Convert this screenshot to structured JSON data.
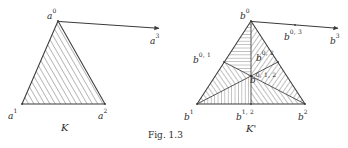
{
  "figure": {
    "caption": "Fig. 1.3",
    "stroke_color": "#3a3a3a",
    "hatch_color": "#4a4a4a",
    "background": "#ffffff"
  },
  "left_complex": {
    "name": "K",
    "vertices": [
      {
        "id": "a0",
        "base": "a",
        "sup": "0",
        "x": 58,
        "y": 21,
        "label_x": 47,
        "label_y": 6
      },
      {
        "id": "a1",
        "base": "a",
        "sup": "1",
        "x": 22,
        "y": 104,
        "label_x": 8,
        "label_y": 106
      },
      {
        "id": "a2",
        "base": "a",
        "sup": "2",
        "x": 105,
        "y": 104,
        "label_x": 98,
        "label_y": 106
      },
      {
        "id": "a3",
        "base": "a",
        "sup": "3",
        "x": 160,
        "y": 29,
        "label_x": 150,
        "label_y": 31
      }
    ],
    "edge_arrow": {
      "from": "a0",
      "to": "a3"
    }
  },
  "right_complex": {
    "name": "K'",
    "vertices": [
      {
        "id": "b0",
        "base": "b",
        "sup": "0",
        "x": 251,
        "y": 21,
        "label_x": 240,
        "label_y": 6
      },
      {
        "id": "b1",
        "base": "b",
        "sup": "1",
        "x": 197,
        "y": 104,
        "label_x": 184,
        "label_y": 107
      },
      {
        "id": "b2",
        "base": "b",
        "sup": "2",
        "x": 305,
        "y": 104,
        "label_x": 298,
        "label_y": 107
      },
      {
        "id": "b3",
        "base": "b",
        "sup": "3",
        "x": 339,
        "y": 29,
        "label_x": 330,
        "label_y": 31
      },
      {
        "id": "b01",
        "base": "b",
        "sup": "0, 1",
        "x": 224,
        "y": 62,
        "label_x": 193,
        "label_y": 50
      },
      {
        "id": "b02",
        "base": "b",
        "sup": "0, 2",
        "x": 278,
        "y": 62,
        "label_x": 256,
        "label_y": 48
      },
      {
        "id": "b12",
        "base": "b",
        "sup": "1, 2",
        "x": 251,
        "y": 104,
        "label_x": 236,
        "label_y": 107
      },
      {
        "id": "b012",
        "base": "b",
        "sup": "0, 1, 2",
        "x": 251,
        "y": 76,
        "label_x": 250,
        "label_y": 70
      },
      {
        "id": "b03",
        "base": "b",
        "sup": "0, 3",
        "x": 295,
        "y": 25,
        "label_x": 284,
        "label_y": 27
      }
    ],
    "edge_arrow": {
      "from": "b0",
      "to": "b3"
    },
    "subdivision_cells": [
      {
        "id": "cell-0-01-012",
        "hatch": "horizontal"
      },
      {
        "id": "cell-0-02-012",
        "hatch": "diagonal-down"
      },
      {
        "id": "cell-1-01-012",
        "hatch": "diagonal-up"
      },
      {
        "id": "cell-1-12-012",
        "hatch": "vertical"
      },
      {
        "id": "cell-2-12-012",
        "hatch": "diagonal-up"
      },
      {
        "id": "cell-2-02-012",
        "hatch": "diagonal-down"
      }
    ]
  }
}
